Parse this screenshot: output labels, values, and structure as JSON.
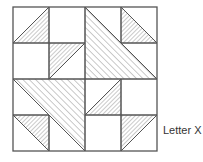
{
  "figure": {
    "caption": "Letter X",
    "colors": {
      "line": "#555555",
      "hatch": "#8a8a8a",
      "background": "#ffffff"
    },
    "block": {
      "x": 13,
      "y": 7,
      "cell": 36,
      "grid": 4
    },
    "hatched_shapes": [
      {
        "name": "small-triangle-top-left",
        "pattern": "fine",
        "points": [
          [
            1,
            0
          ],
          [
            0,
            1
          ],
          [
            1,
            1
          ]
        ]
      },
      {
        "name": "small-triangle-center-left",
        "pattern": "fine",
        "points": [
          [
            1,
            1
          ],
          [
            2,
            1
          ],
          [
            1,
            2
          ]
        ]
      },
      {
        "name": "large-triangle-top-right",
        "pattern": "wide",
        "points": [
          [
            2,
            0
          ],
          [
            2,
            2
          ],
          [
            4,
            2
          ]
        ]
      },
      {
        "name": "small-triangle-top-right",
        "pattern": "fine",
        "points": [
          [
            3,
            0
          ],
          [
            3,
            1
          ],
          [
            4,
            1
          ]
        ]
      },
      {
        "name": "large-triangle-bottom-left",
        "pattern": "wide",
        "points": [
          [
            0,
            2
          ],
          [
            2,
            2
          ],
          [
            2,
            4
          ]
        ]
      },
      {
        "name": "small-triangle-bottom-left",
        "pattern": "fine",
        "points": [
          [
            0,
            3
          ],
          [
            1,
            3
          ],
          [
            1,
            4
          ]
        ]
      },
      {
        "name": "small-triangle-center-right",
        "pattern": "fine",
        "points": [
          [
            3,
            2
          ],
          [
            2,
            3
          ],
          [
            3,
            3
          ]
        ]
      },
      {
        "name": "small-triangle-bottom-right",
        "pattern": "fine",
        "points": [
          [
            3,
            3
          ],
          [
            4,
            3
          ],
          [
            3,
            4
          ]
        ]
      }
    ],
    "grid_lines": [
      [
        [
          1,
          0
        ],
        [
          1,
          2
        ]
      ],
      [
        [
          3,
          0
        ],
        [
          3,
          1
        ]
      ],
      [
        [
          0,
          1
        ],
        [
          2,
          1
        ]
      ],
      [
        [
          3,
          1
        ],
        [
          4,
          1
        ]
      ],
      [
        [
          0,
          2
        ],
        [
          4,
          2
        ]
      ],
      [
        [
          2,
          0
        ],
        [
          2,
          4
        ]
      ],
      [
        [
          3,
          2
        ],
        [
          3,
          4
        ]
      ],
      [
        [
          1,
          3
        ],
        [
          1,
          4
        ]
      ],
      [
        [
          0,
          3
        ],
        [
          1,
          3
        ]
      ],
      [
        [
          2,
          3
        ],
        [
          4,
          3
        ]
      ]
    ]
  }
}
